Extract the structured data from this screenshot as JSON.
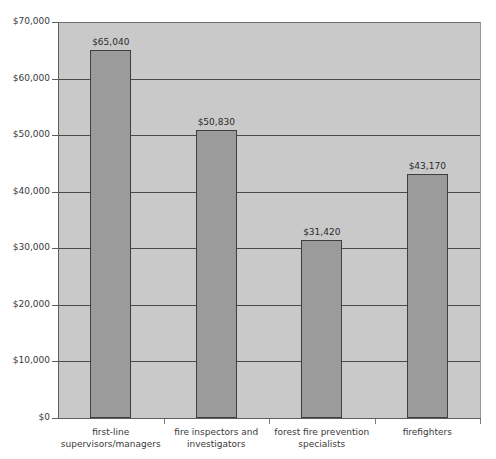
{
  "chart_data": {
    "type": "bar",
    "title": "",
    "xlabel": "",
    "ylabel": "",
    "categories": [
      "first-line supervisors/managers",
      "fire inspectors and investigators",
      "forest fire prevention specialists",
      "firefighters"
    ],
    "values": [
      65040,
      50830,
      31420,
      43170
    ],
    "value_labels": [
      "$65,040",
      "$50,830",
      "$31,420",
      "$43,170"
    ],
    "ylim": [
      0,
      70000
    ],
    "ytick_values": [
      0,
      10000,
      20000,
      30000,
      40000,
      50000,
      60000,
      70000
    ],
    "ytick_labels": [
      "$0",
      "$10,000",
      "$20,000",
      "$30,000",
      "$40,000",
      "$50,000",
      "$60,000",
      "$70,000"
    ],
    "grid": true,
    "legend": false,
    "legend_position": "none",
    "colors": {
      "bar_fill": "#9b9b9b",
      "bar_border": "#3f3f3f",
      "plot_background": "#c9c9c9",
      "gridline": "#4a4a4a",
      "axis": "#5e5e5e",
      "page_background": "#ffffff",
      "text": "#3a3a3a"
    }
  },
  "axes": {
    "y_title": "",
    "x_title": ""
  },
  "header": {
    "title": ""
  }
}
